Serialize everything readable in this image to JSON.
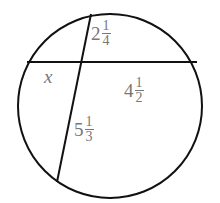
{
  "diagram": {
    "type": "intersecting-chords-in-circle",
    "circle": {
      "cx": 110,
      "cy": 106,
      "r": 92
    },
    "chords": [
      {
        "name": "horizontal-chord",
        "x1": 28,
        "y1": 62,
        "x2": 197,
        "y2": 62
      },
      {
        "name": "slanted-chord",
        "x1": 91,
        "y1": 14,
        "x2": 57,
        "y2": 182
      }
    ],
    "stroke_color": "#111111",
    "label_color": "#777777"
  },
  "labels": {
    "top_segment": {
      "whole": "2",
      "num": "1",
      "den": "4"
    },
    "left_segment": {
      "text": "x"
    },
    "right_segment": {
      "whole": "4",
      "num": "1",
      "den": "2"
    },
    "bottom_segment": {
      "whole": "5",
      "num": "1",
      "den": "3"
    }
  }
}
